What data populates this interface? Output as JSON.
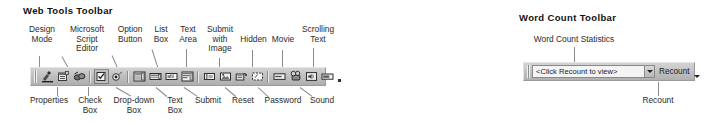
{
  "figure": {
    "web_tools": {
      "heading": "Web Tools Toolbar",
      "top_callouts": [
        {
          "label": "Design\nMode",
          "target": "design-mode"
        },
        {
          "label": "Microsoft\nScript\nEditor",
          "target": "microsoft-script-editor"
        },
        {
          "label": "Option\nButton",
          "target": "option-button"
        },
        {
          "label": "List\nBox",
          "target": "list-box"
        },
        {
          "label": "Text\nArea",
          "target": "text-area"
        },
        {
          "label": "Submit\nwith\nImage",
          "target": "submit-with-image"
        },
        {
          "label": "Hidden",
          "target": "hidden"
        },
        {
          "label": "Movie",
          "target": "movie"
        },
        {
          "label": "Scrolling\nText",
          "target": "scrolling-text"
        }
      ],
      "bottom_callouts": [
        {
          "label": "Properties",
          "target": "properties"
        },
        {
          "label": "Check\nBox",
          "target": "check-box"
        },
        {
          "label": "Drop-down\nBox",
          "target": "drop-down-box"
        },
        {
          "label": "Text\nBox",
          "target": "text-box"
        },
        {
          "label": "Submit",
          "target": "submit"
        },
        {
          "label": "Reset",
          "target": "reset"
        },
        {
          "label": "Password",
          "target": "password"
        },
        {
          "label": "Sound",
          "target": "sound"
        }
      ],
      "buttons": [
        {
          "name": "design-mode-button",
          "icon": "design-mode-icon",
          "pressed": false
        },
        {
          "name": "properties-button",
          "icon": "properties-icon",
          "pressed": false
        },
        {
          "name": "microsoft-script-editor-button",
          "icon": "script-editor-icon",
          "pressed": false
        },
        {
          "name": "check-box-button",
          "icon": "check-box-icon",
          "pressed": true
        },
        {
          "name": "option-button-button",
          "icon": "option-button-icon",
          "pressed": false
        },
        {
          "name": "drop-down-box-button",
          "icon": "drop-down-box-icon",
          "pressed": false
        },
        {
          "name": "list-box-button",
          "icon": "list-box-icon",
          "pressed": false
        },
        {
          "name": "text-box-button",
          "icon": "text-box-icon",
          "pressed": false
        },
        {
          "name": "text-area-button",
          "icon": "text-area-icon",
          "pressed": false
        },
        {
          "name": "submit-button",
          "icon": "submit-icon",
          "pressed": false
        },
        {
          "name": "submit-with-image-button",
          "icon": "submit-with-image-icon",
          "pressed": false
        },
        {
          "name": "reset-button",
          "icon": "reset-icon",
          "pressed": false
        },
        {
          "name": "hidden-button",
          "icon": "hidden-icon",
          "pressed": false
        },
        {
          "name": "password-button",
          "icon": "password-icon",
          "pressed": false
        },
        {
          "name": "movie-button",
          "icon": "movie-icon",
          "pressed": false
        },
        {
          "name": "sound-button",
          "icon": "sound-icon",
          "pressed": false
        },
        {
          "name": "scrolling-text-button",
          "icon": "scrolling-text-icon",
          "pressed": false
        }
      ]
    },
    "word_count": {
      "heading": "Word Count Toolbar",
      "statistics_callout": "Word Count Statistics",
      "recount_callout": "Recount",
      "combo_value": "<Click Recount to view>",
      "recount_label": "Recount"
    }
  },
  "colors": {
    "page_background": "#ffffff",
    "toolbar_face": "#c2c2c2",
    "toolbar_border": "#9a9a9a",
    "combo_field": "#f4f4f4",
    "text": "#1a1a1a",
    "leader_line": "#8c8c8c"
  }
}
